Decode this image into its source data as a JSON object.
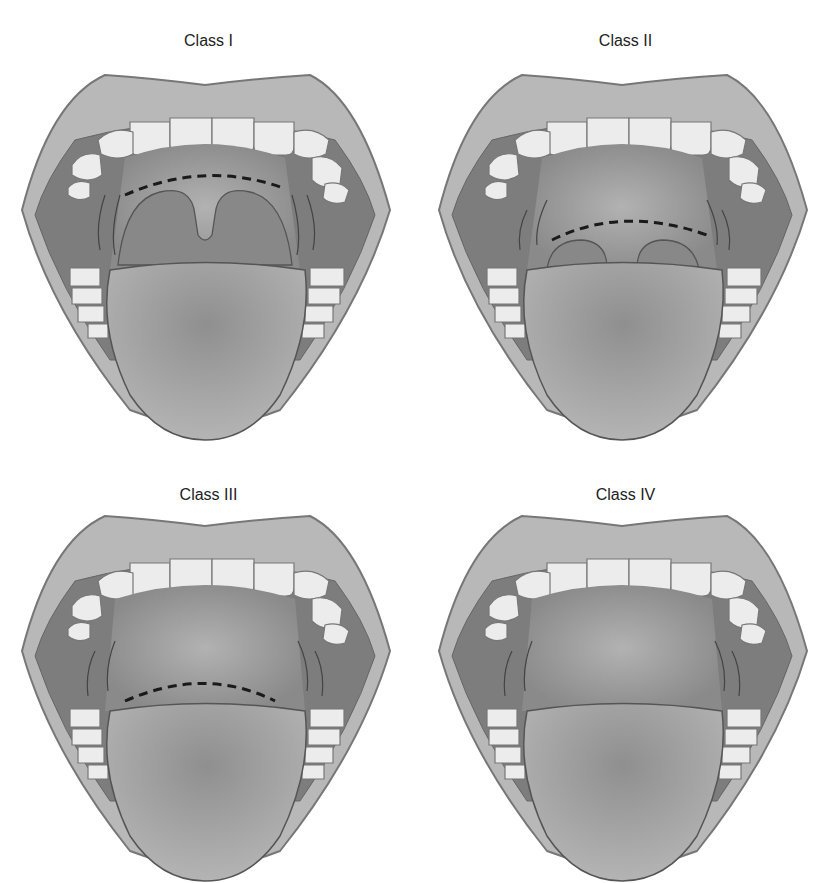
{
  "figure": {
    "panels": [
      {
        "id": "class-1",
        "label": "Class I",
        "uvula": "full",
        "pillars": "visible"
      },
      {
        "id": "class-2",
        "label": "Class II",
        "uvula": "partial",
        "pillars": "partial"
      },
      {
        "id": "class-3",
        "label": "Class III",
        "uvula": "base-only",
        "pillars": "soft-palate-only"
      },
      {
        "id": "class-4",
        "label": "Class IV",
        "uvula": "none",
        "pillars": "hard-palate-only"
      }
    ]
  },
  "colors": {
    "lip": "#b8b8b8",
    "lip_outline": "#777777",
    "cavity": "#7d7d7d",
    "throat": "#a8a8a8",
    "teeth": "#ececec",
    "tongue": "#a0a0a0",
    "soft_palate": "#8a8a8a",
    "dashed_line": "#1a1a1a"
  }
}
